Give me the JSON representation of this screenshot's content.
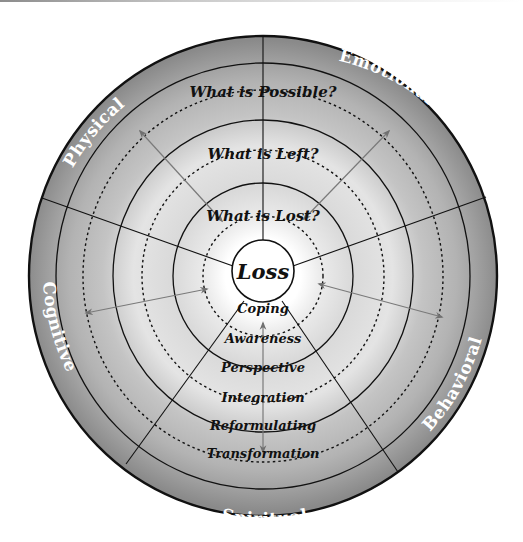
{
  "diagram": {
    "title": "Loss",
    "center": {
      "label": "Loss"
    },
    "questions": [
      {
        "label": "What is Lost?"
      },
      {
        "label": "What is Left?"
      },
      {
        "label": "What is Possible?"
      }
    ],
    "stages": [
      {
        "label": "Coping"
      },
      {
        "label": "Awareness"
      },
      {
        "label": "Perspective"
      },
      {
        "label": "Integration"
      },
      {
        "label": "Reformulating"
      },
      {
        "label": "Transformation"
      }
    ],
    "domains": [
      {
        "label": "Physical"
      },
      {
        "label": "Emotional"
      },
      {
        "label": "Behavioral"
      },
      {
        "label": "Spiritual"
      },
      {
        "label": "Cognitive"
      }
    ],
    "colors": {
      "outer_band": "#8e8e8e",
      "mid_band": "#b4b4b4",
      "inner_band": "#d8d8d8",
      "glow": "#f2f2f2",
      "line": "#111111",
      "arrow": "#777777",
      "domain_text": "#ffffff"
    }
  }
}
